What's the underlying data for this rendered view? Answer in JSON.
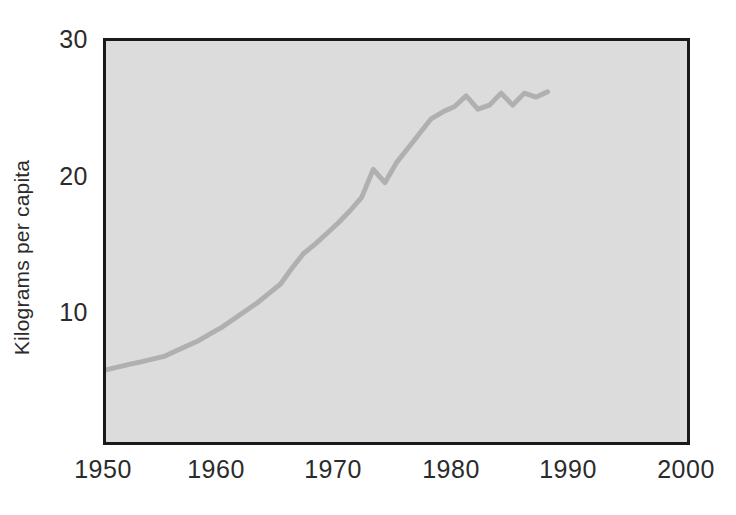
{
  "chart_data": {
    "type": "line",
    "title": "",
    "subtitle": "",
    "xlabel": "",
    "ylabel": "Kilograms per capita",
    "xlim": [
      1950,
      2000
    ],
    "ylim": [
      0,
      30
    ],
    "x_ticks": [
      1950,
      1960,
      1970,
      1980,
      1990,
      2000
    ],
    "x_tick_labels": [
      "1950",
      "1960",
      "1970",
      "1980",
      "1990",
      "2000"
    ],
    "y_ticks": [
      10,
      20,
      30
    ],
    "y_tick_labels": [
      "10",
      "20",
      "30"
    ],
    "grid": false,
    "legend": "none",
    "plot_background": "#dcdcdc",
    "line_color": "#b0b0b0",
    "axis_color": "#1a1a1a",
    "series": [
      {
        "name": "Kilograms per capita",
        "x": [
          1950,
          1951,
          1952,
          1953,
          1954,
          1955,
          1956,
          1957,
          1958,
          1959,
          1960,
          1961,
          1962,
          1963,
          1964,
          1965,
          1966,
          1967,
          1968,
          1969,
          1970,
          1971,
          1972,
          1973,
          1974,
          1975,
          1976,
          1977,
          1978,
          1979,
          1980,
          1981,
          1982,
          1983,
          1984,
          1985,
          1986,
          1987,
          1988
        ],
        "values": [
          5.4,
          5.6,
          5.8,
          6.0,
          6.2,
          6.4,
          6.8,
          7.2,
          7.6,
          8.1,
          8.6,
          9.2,
          9.8,
          10.4,
          11.1,
          11.8,
          13.0,
          14.1,
          14.8,
          15.6,
          16.4,
          17.3,
          18.3,
          20.4,
          19.4,
          20.9,
          22.0,
          23.1,
          24.2,
          24.7,
          25.1,
          25.9,
          24.9,
          25.2,
          26.1,
          25.2,
          26.1,
          25.8,
          26.2
        ]
      }
    ]
  }
}
